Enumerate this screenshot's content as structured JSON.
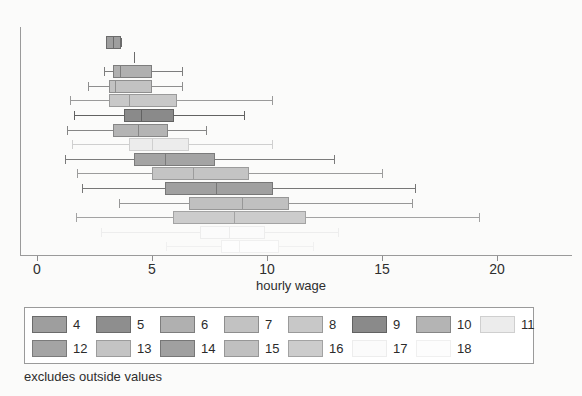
{
  "chart_data": {
    "type": "box",
    "title": "",
    "xlabel": "hourly wage",
    "ylabel": "",
    "xlim": [
      0,
      22.5
    ],
    "xticks": [
      0,
      5,
      10,
      15,
      20
    ],
    "xticklabels": [
      "0",
      "5",
      "10",
      "15",
      "20"
    ],
    "grid": false,
    "note": "excludes outside values",
    "legend_position": "below-axes",
    "group_label": "education (years)",
    "boxes": [
      {
        "group": "4",
        "whisker_low": 3.0,
        "q1": 3.0,
        "median": 3.3,
        "q3": 3.65,
        "whisker_high": 3.65,
        "fill": "#9e9e9e",
        "edge": "#6b6b6b"
      },
      {
        "group": "5",
        "whisker_low": 4.2,
        "q1": 4.2,
        "median": 4.2,
        "q3": 4.2,
        "whisker_high": 4.2,
        "fill": "#8e8e8e",
        "edge": "#6b6b6b",
        "degenerate": true
      },
      {
        "group": "6",
        "whisker_low": 2.9,
        "q1": 3.3,
        "median": 3.6,
        "q3": 5.0,
        "whisker_high": 6.3,
        "fill": "#b0b0b0",
        "edge": "#7d7d7d"
      },
      {
        "group": "7",
        "whisker_low": 2.2,
        "q1": 3.15,
        "median": 3.4,
        "q3": 5.0,
        "whisker_high": 6.3,
        "fill": "#c2c2c2",
        "edge": "#8e8e8e"
      },
      {
        "group": "8",
        "whisker_low": 1.45,
        "q1": 3.15,
        "median": 4.0,
        "q3": 6.1,
        "whisker_high": 10.2,
        "fill": "#c8c8c8",
        "edge": "#9a9a9a"
      },
      {
        "group": "9",
        "whisker_low": 1.6,
        "q1": 3.8,
        "median": 4.5,
        "q3": 5.95,
        "whisker_high": 9.0,
        "fill": "#8a8a8a",
        "edge": "#626262"
      },
      {
        "group": "10",
        "whisker_low": 1.3,
        "q1": 3.3,
        "median": 4.4,
        "q3": 5.7,
        "whisker_high": 7.35,
        "fill": "#b4b4b4",
        "edge": "#868686"
      },
      {
        "group": "11",
        "whisker_low": 1.5,
        "q1": 4.0,
        "median": 5.0,
        "q3": 6.6,
        "whisker_high": 10.2,
        "fill": "#ececec",
        "edge": "#cfcfcf"
      },
      {
        "group": "12",
        "whisker_low": 1.2,
        "q1": 4.2,
        "median": 5.55,
        "q3": 7.75,
        "whisker_high": 12.9,
        "fill": "#a4a4a4",
        "edge": "#7b7b7b"
      },
      {
        "group": "13",
        "whisker_low": 1.75,
        "q1": 5.0,
        "median": 6.8,
        "q3": 9.2,
        "whisker_high": 15.0,
        "fill": "#c4c4c4",
        "edge": "#9c9c9c"
      },
      {
        "group": "14",
        "whisker_low": 1.95,
        "q1": 5.55,
        "median": 7.8,
        "q3": 10.25,
        "whisker_high": 16.45,
        "fill": "#a0a0a0",
        "edge": "#777777"
      },
      {
        "group": "15",
        "whisker_low": 3.55,
        "q1": 6.6,
        "median": 8.9,
        "q3": 10.95,
        "whisker_high": 16.3,
        "fill": "#c0c0c0",
        "edge": "#979797"
      },
      {
        "group": "16",
        "whisker_low": 1.7,
        "q1": 5.9,
        "median": 8.55,
        "q3": 11.7,
        "whisker_high": 19.2,
        "fill": "#cccccc",
        "edge": "#a3a3a3"
      },
      {
        "group": "17",
        "whisker_low": 2.8,
        "q1": 7.1,
        "median": 8.35,
        "q3": 9.9,
        "whisker_high": 13.1,
        "fill": "#fbfbfb",
        "edge": "#ededed"
      },
      {
        "group": "18",
        "whisker_low": 5.6,
        "q1": 8.0,
        "median": 8.8,
        "q3": 10.5,
        "whisker_high": 12.0,
        "fill": "#fdfdfd",
        "edge": "#f0f0f0"
      }
    ]
  },
  "axis": {
    "xlabel": "hourly wage",
    "ticks": [
      {
        "value": 0,
        "label": "0"
      },
      {
        "value": 5,
        "label": "5"
      },
      {
        "value": 10,
        "label": "10"
      },
      {
        "value": 15,
        "label": "15"
      },
      {
        "value": 20,
        "label": "20"
      }
    ]
  },
  "legend": {
    "rows": [
      [
        {
          "label": "4",
          "fill": "#9e9e9e",
          "edge": "#6b6b6b"
        },
        {
          "label": "5",
          "fill": "#8e8e8e",
          "edge": "#6b6b6b"
        },
        {
          "label": "6",
          "fill": "#b0b0b0",
          "edge": "#7d7d7d"
        },
        {
          "label": "7",
          "fill": "#c2c2c2",
          "edge": "#8e8e8e"
        },
        {
          "label": "8",
          "fill": "#c8c8c8",
          "edge": "#9a9a9a"
        },
        {
          "label": "9",
          "fill": "#8a8a8a",
          "edge": "#626262"
        },
        {
          "label": "10",
          "fill": "#b4b4b4",
          "edge": "#868686"
        },
        {
          "label": "11",
          "fill": "#ececec",
          "edge": "#cfcfcf"
        }
      ],
      [
        {
          "label": "12",
          "fill": "#a4a4a4",
          "edge": "#7b7b7b"
        },
        {
          "label": "13",
          "fill": "#c4c4c4",
          "edge": "#9c9c9c"
        },
        {
          "label": "14",
          "fill": "#a0a0a0",
          "edge": "#777777"
        },
        {
          "label": "15",
          "fill": "#c0c0c0",
          "edge": "#979797"
        },
        {
          "label": "16",
          "fill": "#cccccc",
          "edge": "#a3a3a3"
        },
        {
          "label": "17",
          "fill": "#fbfbfb",
          "edge": "#ededed"
        },
        {
          "label": "18",
          "fill": "#fdfdfd",
          "edge": "#f0f0f0"
        }
      ]
    ]
  },
  "footnote": "excludes outside values"
}
